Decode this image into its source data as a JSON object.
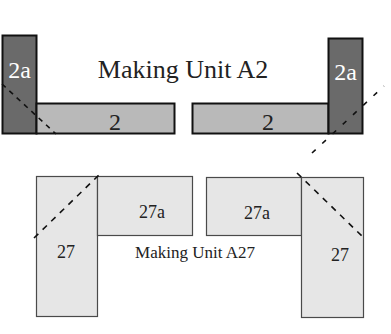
{
  "colors": {
    "dark_piece": "#6a6a6a",
    "mid_piece": "#b9b9b9",
    "light_piece": "#e6e6e6",
    "outline_dark": "#111111",
    "outline_light": "#4a4a4a",
    "text_dark": "#222222",
    "text_light": "#ffffff"
  },
  "unit_a2": {
    "title": "Making Unit A2",
    "left": {
      "tall_label": "2a",
      "bar_label": "2"
    },
    "right": {
      "tall_label": "2a",
      "bar_label": "2"
    }
  },
  "unit_a27": {
    "title": "Making Unit A27",
    "left": {
      "tall_label": "27",
      "bar_label": "27a"
    },
    "right": {
      "tall_label": "27",
      "bar_label": "27a"
    }
  }
}
